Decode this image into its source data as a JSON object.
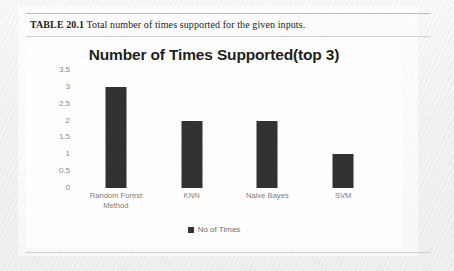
{
  "figure": {
    "caption_label": "TABLE 20.1",
    "caption_text": "Total number of times supported for the given inputs."
  },
  "chart_data": {
    "type": "bar",
    "title": "Number of Times Supported(top 3)",
    "categories": [
      "Random Forest Method",
      "KNN",
      "Naive Bayes",
      "SVM"
    ],
    "category_lines": [
      [
        "Random Forest",
        "Method"
      ],
      [
        "KNN"
      ],
      [
        "Naive Bayes"
      ],
      [
        "SVM"
      ]
    ],
    "values": [
      3,
      2,
      2,
      1
    ],
    "series": [
      {
        "name": "No of Times",
        "values": [
          3,
          2,
          2,
          1
        ]
      }
    ],
    "xlabel": "",
    "ylabel": "",
    "ylim": [
      0,
      3.5
    ],
    "yticks": [
      "3.5",
      "3",
      "2.5",
      "2",
      "1.5",
      "1",
      "0.5",
      "0"
    ],
    "ytick_values": [
      3.5,
      3,
      2.5,
      2,
      1.5,
      1,
      0.5,
      0
    ],
    "grid": false,
    "legend": {
      "position": "bottom",
      "entries": [
        {
          "label": "No of Times",
          "color": "#333132"
        }
      ]
    },
    "bar_color": "#333132"
  }
}
